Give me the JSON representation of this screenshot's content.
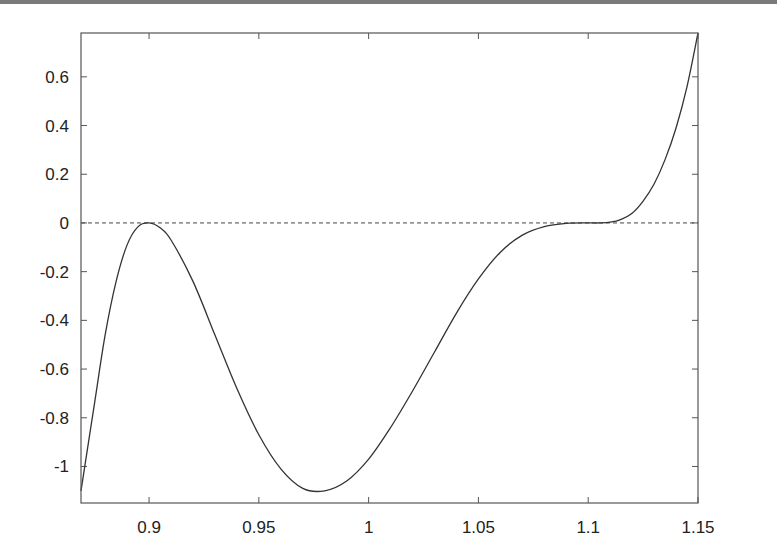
{
  "chart_data": {
    "type": "line",
    "title": "",
    "xlabel": "",
    "ylabel": "",
    "xlim": [
      0.869,
      1.15
    ],
    "ylim": [
      -1.15,
      0.78
    ],
    "grid": false,
    "legend": null,
    "x_ticks": [
      "0.9",
      "0.95",
      "1",
      "1.05",
      "1.1",
      "1.15"
    ],
    "x_tick_values": [
      0.9,
      0.95,
      1.0,
      1.05,
      1.1,
      1.15
    ],
    "y_ticks": [
      "0.6",
      "0.4",
      "0.2",
      "0",
      "-0.2",
      "-0.4",
      "-0.6",
      "-0.8",
      "-1"
    ],
    "y_tick_values": [
      0.6,
      0.4,
      0.2,
      0,
      -0.2,
      -0.4,
      -0.6,
      -0.8,
      -1
    ],
    "series": [
      {
        "name": "curve",
        "style": "solid",
        "x": [
          0.869,
          0.875,
          0.88,
          0.885,
          0.89,
          0.895,
          0.9,
          0.905,
          0.91,
          0.92,
          0.93,
          0.94,
          0.95,
          0.96,
          0.97,
          0.98,
          0.99,
          1.0,
          1.01,
          1.02,
          1.03,
          1.04,
          1.05,
          1.06,
          1.07,
          1.08,
          1.09,
          1.1,
          1.105,
          1.11,
          1.115,
          1.12,
          1.125,
          1.13,
          1.135,
          1.14,
          1.145,
          1.15
        ],
        "y": [
          -1.1,
          -0.75,
          -0.46,
          -0.24,
          -0.09,
          -0.015,
          0.0,
          -0.02,
          -0.07,
          -0.24,
          -0.46,
          -0.68,
          -0.87,
          -1.01,
          -1.09,
          -1.1,
          -1.06,
          -0.97,
          -0.84,
          -0.69,
          -0.53,
          -0.37,
          -0.23,
          -0.12,
          -0.05,
          -0.015,
          -0.002,
          0.0,
          0.0,
          0.003,
          0.015,
          0.04,
          0.09,
          0.16,
          0.26,
          0.39,
          0.56,
          0.78
        ]
      },
      {
        "name": "zero-line",
        "style": "dashed",
        "x": [
          0.869,
          1.15
        ],
        "y": [
          0,
          0
        ]
      }
    ]
  },
  "colors": {
    "curve": "#333333",
    "axis": "#555555",
    "zero_line": "#444444",
    "top_rule": "#7a7a7a"
  }
}
